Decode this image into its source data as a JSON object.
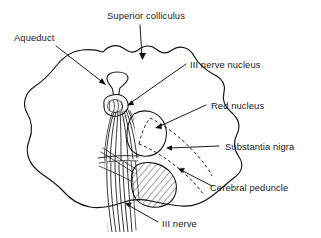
{
  "figure": {
    "ink_color": "#111111",
    "background_color": "#ffffff",
    "width": 321,
    "height": 238
  },
  "labels": {
    "aqueduct": "Aqueduct",
    "superior_colliculus": "Superior colliculus",
    "third_nerve_nucleus": "III nerve nucleus",
    "red_nucleus": "Red nucleus",
    "substantia_nigra": "Substantia nigra",
    "cerebral_peduncle": "Cerebral peduncle",
    "third_nerve": "III nerve"
  }
}
